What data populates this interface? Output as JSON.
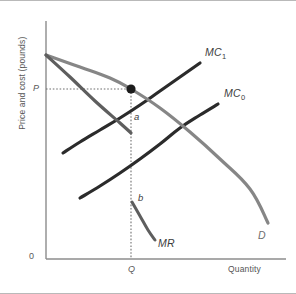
{
  "figure": {
    "background": "#ffffff",
    "frame_color": "#b9b9b9"
  },
  "axes": {
    "y_title": "Price and cost (pounds)",
    "x_title": "Quantity",
    "origin_label": "0",
    "axis_color": "#8c8c8c",
    "x_axis_y": 258,
    "y_axis_x": 46,
    "x_axis_start": 46,
    "x_axis_end": 286,
    "y_axis_top": 20
  },
  "ticks": {
    "price": {
      "label": "P",
      "x": 33,
      "y": 83,
      "value_y": 88
    },
    "quantity": {
      "label": "Q",
      "x": 128,
      "y": 264,
      "value_x": 131
    }
  },
  "guides": {
    "color": "#6f6f6f",
    "horizontal": {
      "x1": 46,
      "x2": 131,
      "y": 88
    },
    "vertical": {
      "x": 131,
      "y1": 88,
      "y2": 258
    }
  },
  "marker": {
    "name": "equilibrium-point",
    "x": 131,
    "y": 88,
    "radius": 4.6,
    "color": "#1c1c1c"
  },
  "chart_data": {
    "type": "line",
    "title": "",
    "xlabel": "Quantity",
    "ylabel": "Price and cost (pounds)",
    "grid": false,
    "legend": "inline-curve-labels",
    "axis_tick_labels": {
      "x": [
        "0",
        "Q"
      ],
      "y": [
        "P"
      ]
    },
    "annotations": [
      {
        "label": "a",
        "x": 134,
        "y": 118,
        "note": "point on MC1 above MR intersection"
      },
      {
        "label": "b",
        "x": 138,
        "y": 199,
        "note": "point where MR meets Q"
      },
      {
        "label": "P",
        "x": 33,
        "y": 83,
        "note": "price level on vertical axis"
      },
      {
        "label": "Q",
        "x": 128,
        "y": 264,
        "note": "quantity level on horizontal axis"
      }
    ],
    "series": [
      {
        "name": "MC_1",
        "display_label": "MC",
        "subscript": "1",
        "color": "#2b2b2b",
        "width": 3.2,
        "label_pos": {
          "x": 205,
          "y": 52
        },
        "points": [
          [
            63,
            152
          ],
          [
            80,
            141
          ],
          [
            100,
            129
          ],
          [
            120,
            117
          ],
          [
            140,
            104
          ],
          [
            160,
            90
          ],
          [
            180,
            76
          ],
          [
            200,
            62
          ]
        ]
      },
      {
        "name": "MC_0",
        "display_label": "MC",
        "subscript": "0",
        "color": "#2b2b2b",
        "width": 3.2,
        "label_pos": {
          "x": 224,
          "y": 93
        },
        "points": [
          [
            80,
            197
          ],
          [
            100,
            185
          ],
          [
            120,
            172
          ],
          [
            140,
            158
          ],
          [
            160,
            143
          ],
          [
            180,
            127
          ],
          [
            200,
            114
          ],
          [
            218,
            103
          ]
        ]
      },
      {
        "name": "D",
        "display_label": "D",
        "subscript": "",
        "color": "#868686",
        "width": 3.2,
        "label_pos": {
          "x": 258,
          "y": 235
        },
        "points": [
          [
            46,
            54
          ],
          [
            80,
            66
          ],
          [
            110,
            77
          ],
          [
            131,
            88
          ],
          [
            160,
            107
          ],
          [
            190,
            131
          ],
          [
            220,
            158
          ],
          [
            250,
            188
          ],
          [
            268,
            222
          ]
        ]
      },
      {
        "name": "MR",
        "display_label": "MR",
        "subscript": "",
        "color": "#5e5e5e",
        "width": 3.2,
        "label_pos": {
          "x": 158,
          "y": 243
        },
        "points": [
          [
            46,
            54
          ],
          [
            70,
            76
          ],
          [
            95,
            100
          ],
          [
            120,
            122
          ],
          [
            131,
            132
          ]
        ]
      },
      {
        "name": "MR_lower",
        "display_label": "",
        "subscript": "",
        "color": "#5e5e5e",
        "width": 3.0,
        "label_pos": null,
        "points": [
          [
            132,
            201
          ],
          [
            140,
            215
          ],
          [
            148,
            229
          ],
          [
            155,
            239
          ]
        ]
      }
    ]
  }
}
